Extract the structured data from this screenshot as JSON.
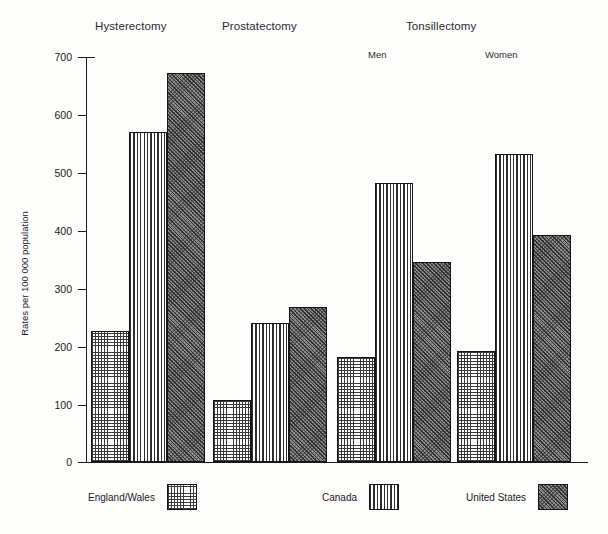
{
  "chart_data": {
    "type": "bar",
    "title": "",
    "xlabel": "",
    "ylabel": "Rates per 100 000 population",
    "ylim": [
      0,
      700
    ],
    "yticks": [
      0,
      100,
      200,
      300,
      400,
      500,
      600,
      700
    ],
    "ytick_labels": [
      "0",
      "100",
      "200",
      "300",
      "400",
      "500",
      "600",
      "700"
    ],
    "grid": false,
    "legend_position": "bottom",
    "categories": [
      "Hysterectomy",
      "Prostatectomy",
      "Tonsillectomy Men",
      "Tonsillectomy Women"
    ],
    "group_headers": [
      "Hysterectomy",
      "Prostatectomy",
      "Tonsillectomy"
    ],
    "sub_headers": [
      "Men",
      "Women"
    ],
    "series": [
      {
        "name": "England/Wales",
        "pattern": "grid",
        "values": [
          227,
          108,
          182,
          191
        ]
      },
      {
        "name": "Canada",
        "pattern": "vertical",
        "values": [
          571,
          240,
          482,
          532
        ]
      },
      {
        "name": "United States",
        "pattern": "diagonal",
        "values": [
          672,
          268,
          345,
          393
        ]
      }
    ]
  },
  "groups": [
    {
      "label": "Hysterectomy",
      "sub": ""
    },
    {
      "label": "Prostatectomy",
      "sub": ""
    },
    {
      "label": "Tonsillectomy",
      "sub": "Men"
    },
    {
      "label": "",
      "sub": "Women"
    }
  ],
  "axis": {
    "ylabel": "Rates per 100 000 population",
    "ticks": [
      "700",
      "600",
      "500",
      "400",
      "300",
      "200",
      "100",
      "0"
    ]
  },
  "legend": {
    "items": [
      {
        "label": "England/Wales"
      },
      {
        "label": "Canada"
      },
      {
        "label": "United States"
      }
    ]
  },
  "bars": {
    "b0": "227",
    "b1": "571",
    "b2": "672",
    "b3": "108",
    "b4": "240",
    "b5": "268",
    "b6": "182",
    "b7": "482",
    "b8": "345",
    "b9": "191",
    "b10": "532",
    "b11": "393"
  }
}
